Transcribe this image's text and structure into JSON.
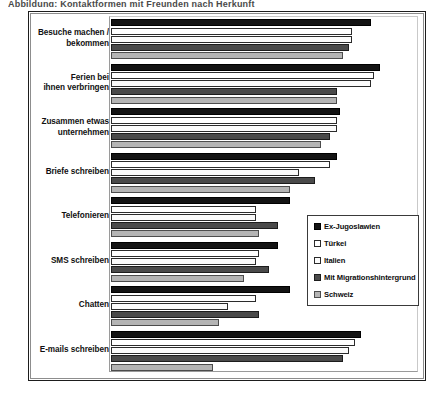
{
  "top_clipped_text": "Abbildung: Kontaktformen mit Freunden nach Herkunft",
  "legend": {
    "position": "inside-right",
    "entries": [
      {
        "label": "Ex-Jugoslawien",
        "color": "#131313"
      },
      {
        "label": "Türkei",
        "color": "#ffffff"
      },
      {
        "label": "Italien",
        "color": "#fbfbfb"
      },
      {
        "label": "Mit Migrationshintergrund",
        "color": "#4a4a4a"
      },
      {
        "label": "Schweiz",
        "color": "#b4b4b4"
      }
    ]
  },
  "chart_data": {
    "type": "bar",
    "orientation": "horizontal",
    "title": "",
    "xlabel": "",
    "ylabel": "",
    "grid": false,
    "xlim": [
      0,
      100
    ],
    "axis_ticks_visible": false,
    "categories": [
      "Besuche machen / bekommen",
      "Ferien bei ihnen verbringen",
      "Zusammen etwas unternehmen",
      "Briefe schreiben",
      "Telefonieren",
      "SMS schreiben",
      "Chatten",
      "E-mails schreiben"
    ],
    "series": [
      {
        "name": "Ex-Jugoslawien",
        "color": "#131313",
        "values": [
          84,
          87,
          74,
          73,
          58,
          54,
          58,
          81
        ]
      },
      {
        "name": "Türkei",
        "color": "#ffffff",
        "values": [
          78,
          85,
          73,
          71,
          47,
          48,
          47,
          79
        ]
      },
      {
        "name": "Italien",
        "color": "#fbfbfb",
        "values": [
          78,
          84,
          73,
          61,
          47,
          47,
          38,
          77
        ]
      },
      {
        "name": "Mit Migrationshintergrund",
        "color": "#4a4a4a",
        "values": [
          77,
          73,
          71,
          66,
          54,
          51,
          48,
          75
        ]
      },
      {
        "name": "Schweiz",
        "color": "#b4b4b4",
        "values": [
          75,
          73,
          68,
          58,
          48,
          43,
          35,
          33
        ]
      }
    ]
  }
}
